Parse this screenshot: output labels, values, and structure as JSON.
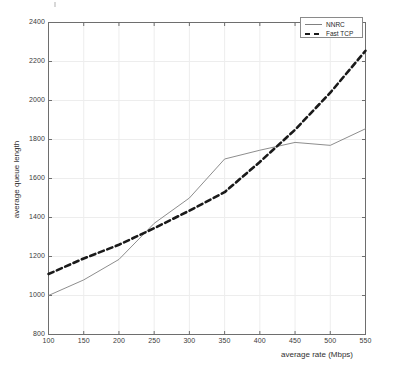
{
  "chart_data": {
    "type": "line",
    "title": "",
    "xlabel": "average rate (Mbps)",
    "ylabel": "average queue length",
    "xlim": [
      100,
      550
    ],
    "ylim": [
      800,
      2400
    ],
    "xticks": [
      100,
      150,
      200,
      250,
      300,
      350,
      400,
      450,
      500,
      550
    ],
    "yticks": [
      800,
      1000,
      1200,
      1400,
      1600,
      1800,
      2000,
      2200,
      2400
    ],
    "grid": true,
    "legend_position": "upper right",
    "x": [
      100,
      150,
      200,
      250,
      300,
      350,
      400,
      450,
      500,
      550
    ],
    "series": [
      {
        "name": "NNRC",
        "style": "solid",
        "color": "#808080",
        "values": [
          1000,
          1080,
          1185,
          1370,
          1500,
          1700,
          1745,
          1785,
          1770,
          1855
        ]
      },
      {
        "name": "Fast TCP",
        "style": "dashed",
        "color": "#1a1a1a",
        "values": [
          1110,
          1190,
          1260,
          1345,
          1435,
          1530,
          1685,
          1850,
          2040,
          2255
        ]
      }
    ]
  },
  "axes": {
    "xtick_labels": [
      "100",
      "150",
      "200",
      "250",
      "300",
      "350",
      "400",
      "450",
      "500",
      "550"
    ],
    "ytick_labels": [
      "800",
      "1000",
      "1200",
      "1400",
      "1600",
      "1800",
      "2000",
      "2200",
      "2400"
    ],
    "xaxis_title": "average rate (Mbps)",
    "yaxis_title": "average queue length"
  },
  "legend": {
    "entries": [
      {
        "label": "NNRC",
        "style": "solid"
      },
      {
        "label": "Fast TCP",
        "style": "dashed"
      }
    ]
  },
  "colors": {
    "background": "#ffffff",
    "axis": "#6e6e6e",
    "grid": "#ededed",
    "nnrc": "#808080",
    "fast_tcp": "#1a1a1a",
    "text": "#303030"
  }
}
